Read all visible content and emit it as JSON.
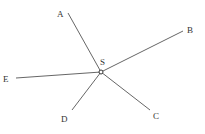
{
  "diagram": {
    "type": "star-graph",
    "center": {
      "id": "S",
      "label": "S",
      "x": 101,
      "y": 72,
      "label_x": 100,
      "label_y": 65
    },
    "nodes": [
      {
        "id": "A",
        "label": "A",
        "end_x": 68,
        "end_y": 13,
        "label_x": 57,
        "label_y": 17
      },
      {
        "id": "B",
        "label": "B",
        "end_x": 183,
        "end_y": 31,
        "label_x": 187,
        "label_y": 33
      },
      {
        "id": "C",
        "label": "C",
        "end_x": 150,
        "end_y": 110,
        "label_x": 153,
        "label_y": 119
      },
      {
        "id": "D",
        "label": "D",
        "end_x": 72,
        "end_y": 110,
        "label_x": 61,
        "label_y": 122
      },
      {
        "id": "E",
        "label": "E",
        "end_x": 16,
        "end_y": 78,
        "label_x": 3,
        "label_y": 82
      }
    ],
    "edges": [
      {
        "from": "S",
        "to": "A"
      },
      {
        "from": "S",
        "to": "B"
      },
      {
        "from": "S",
        "to": "C"
      },
      {
        "from": "S",
        "to": "D"
      },
      {
        "from": "S",
        "to": "E"
      }
    ],
    "colors": {
      "line": "#555555",
      "text": "#333333",
      "background": "#ffffff"
    }
  }
}
